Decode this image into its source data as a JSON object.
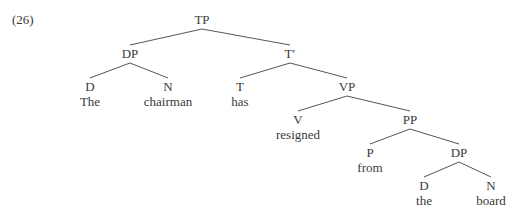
{
  "example_number": "(26)",
  "tree": {
    "nodes": [
      {
        "id": "TP",
        "label": "TP",
        "x": 202,
        "y": 13,
        "type": "category"
      },
      {
        "id": "DP1",
        "label": "DP",
        "x": 130,
        "y": 47,
        "type": "category"
      },
      {
        "id": "Tbar",
        "label": "T′",
        "x": 290,
        "y": 47,
        "type": "category"
      },
      {
        "id": "D1",
        "label": "D",
        "x": 90,
        "y": 80,
        "type": "category"
      },
      {
        "id": "N1",
        "label": "N",
        "x": 168,
        "y": 80,
        "type": "category"
      },
      {
        "id": "T",
        "label": "T",
        "x": 240,
        "y": 80,
        "type": "category"
      },
      {
        "id": "VP",
        "label": "VP",
        "x": 347,
        "y": 80,
        "type": "category"
      },
      {
        "id": "V",
        "label": "V",
        "x": 298,
        "y": 113,
        "type": "category"
      },
      {
        "id": "PP",
        "label": "PP",
        "x": 410,
        "y": 113,
        "type": "category"
      },
      {
        "id": "P",
        "label": "P",
        "x": 370,
        "y": 146,
        "type": "category"
      },
      {
        "id": "DP2",
        "label": "DP",
        "x": 459,
        "y": 146,
        "type": "category"
      },
      {
        "id": "D2",
        "label": "D",
        "x": 424,
        "y": 179,
        "type": "category"
      },
      {
        "id": "N2",
        "label": "N",
        "x": 491,
        "y": 179,
        "type": "category"
      },
      {
        "id": "w_the1",
        "label": "The",
        "x": 90,
        "y": 95,
        "type": "word"
      },
      {
        "id": "w_chairman",
        "label": "chairman",
        "x": 168,
        "y": 95,
        "type": "word"
      },
      {
        "id": "w_has",
        "label": "has",
        "x": 240,
        "y": 95,
        "type": "word"
      },
      {
        "id": "w_resigned",
        "label": "resigned",
        "x": 298,
        "y": 128,
        "type": "word"
      },
      {
        "id": "w_from",
        "label": "from",
        "x": 370,
        "y": 161,
        "type": "word"
      },
      {
        "id": "w_the2",
        "label": "the",
        "x": 424,
        "y": 194,
        "type": "word"
      },
      {
        "id": "w_board",
        "label": "board",
        "x": 491,
        "y": 194,
        "type": "word"
      }
    ],
    "edges": [
      [
        "TP",
        "DP1"
      ],
      [
        "TP",
        "Tbar"
      ],
      [
        "DP1",
        "D1"
      ],
      [
        "DP1",
        "N1"
      ],
      [
        "Tbar",
        "T"
      ],
      [
        "Tbar",
        "VP"
      ],
      [
        "VP",
        "V"
      ],
      [
        "VP",
        "PP"
      ],
      [
        "PP",
        "P"
      ],
      [
        "PP",
        "DP2"
      ],
      [
        "DP2",
        "D2"
      ],
      [
        "DP2",
        "N2"
      ]
    ],
    "line_color": "#555555",
    "text_color": "#3a3a3a"
  }
}
